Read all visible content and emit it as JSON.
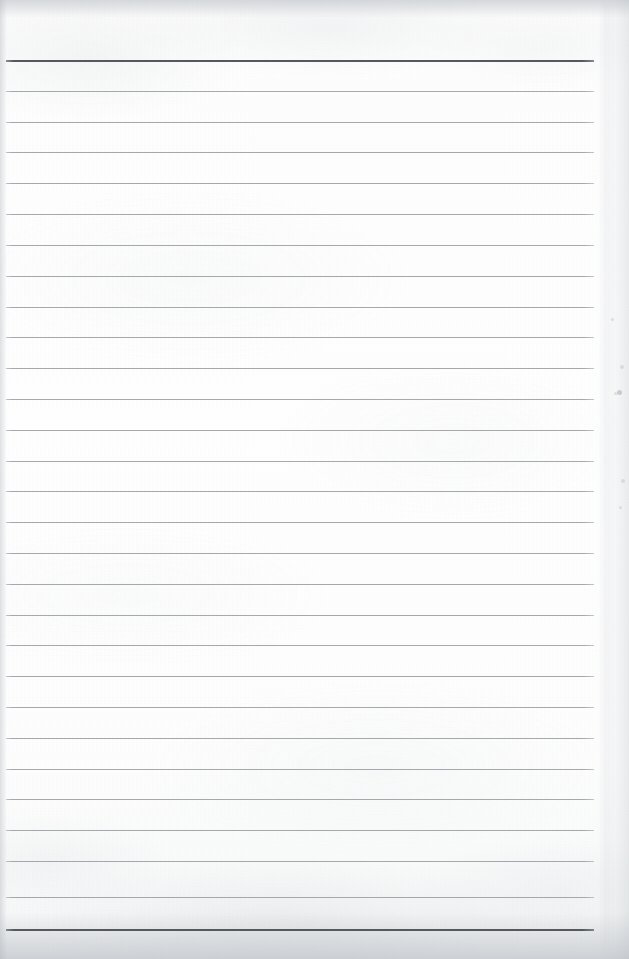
{
  "document": {
    "kind": "scanned-lined-paper",
    "title": "Blank lined notebook page (scan)",
    "page_width": 629,
    "page_height": 959,
    "background_color": "#fdfdfd",
    "text_content": "",
    "has_handwriting": false,
    "has_printed_text": false
  },
  "ruling": {
    "line_color": "#a0a4a9",
    "accent_line_color": "#55585d",
    "line_count": 29,
    "first_line_y": 60,
    "line_spacing": 30.75,
    "line_left_x": 6,
    "line_right_x": 594,
    "thin_line_height": 1,
    "accent_line_height": 2,
    "accent_line_indices": [
      0,
      28
    ],
    "lines": [
      {
        "index": 0,
        "y": 60,
        "weight": "accent"
      },
      {
        "index": 1,
        "y": 91,
        "weight": "thin"
      },
      {
        "index": 2,
        "y": 122,
        "weight": "thin"
      },
      {
        "index": 3,
        "y": 152,
        "weight": "thin"
      },
      {
        "index": 4,
        "y": 183,
        "weight": "thin"
      },
      {
        "index": 5,
        "y": 214,
        "weight": "thin"
      },
      {
        "index": 6,
        "y": 245,
        "weight": "thin"
      },
      {
        "index": 7,
        "y": 276,
        "weight": "thin"
      },
      {
        "index": 8,
        "y": 307,
        "weight": "thin"
      },
      {
        "index": 9,
        "y": 337,
        "weight": "thin"
      },
      {
        "index": 10,
        "y": 368,
        "weight": "thin"
      },
      {
        "index": 11,
        "y": 399,
        "weight": "thin"
      },
      {
        "index": 12,
        "y": 430,
        "weight": "thin"
      },
      {
        "index": 13,
        "y": 461,
        "weight": "thin"
      },
      {
        "index": 14,
        "y": 491,
        "weight": "thin"
      },
      {
        "index": 15,
        "y": 522,
        "weight": "thin"
      },
      {
        "index": 16,
        "y": 553,
        "weight": "thin"
      },
      {
        "index": 17,
        "y": 584,
        "weight": "thin"
      },
      {
        "index": 18,
        "y": 615,
        "weight": "thin"
      },
      {
        "index": 19,
        "y": 645,
        "weight": "thin"
      },
      {
        "index": 20,
        "y": 676,
        "weight": "thin"
      },
      {
        "index": 21,
        "y": 707,
        "weight": "thin"
      },
      {
        "index": 22,
        "y": 738,
        "weight": "thin"
      },
      {
        "index": 23,
        "y": 769,
        "weight": "thin"
      },
      {
        "index": 24,
        "y": 799,
        "weight": "thin"
      },
      {
        "index": 25,
        "y": 830,
        "weight": "thin"
      },
      {
        "index": 26,
        "y": 861,
        "weight": "thin"
      },
      {
        "index": 27,
        "y": 897,
        "weight": "thin"
      },
      {
        "index": 28,
        "y": 929,
        "weight": "accent"
      }
    ]
  },
  "margins": {
    "top_blank_height": 60,
    "bottom_blank_height": 30,
    "left_shadow_width": 7,
    "right_shadow_width": 22
  },
  "artifacts": {
    "specks": [
      {
        "x": 620,
        "y": 365,
        "size": 4,
        "tone": "soft"
      },
      {
        "x": 617,
        "y": 390,
        "size": 5,
        "tone": "normal"
      },
      {
        "x": 614,
        "y": 392,
        "size": 3,
        "tone": "soft"
      },
      {
        "x": 621,
        "y": 479,
        "size": 4,
        "tone": "soft"
      },
      {
        "x": 619,
        "y": 506,
        "size": 3,
        "tone": "soft"
      },
      {
        "x": 611,
        "y": 318,
        "size": 3,
        "tone": "soft"
      }
    ]
  }
}
